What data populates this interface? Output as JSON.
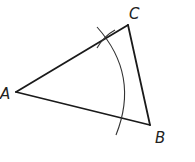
{
  "diagram": {
    "type": "geometric-construction",
    "colors": {
      "stroke": "#1a1a1a",
      "arc": "#333333",
      "background": "#ffffff"
    },
    "vertices": [
      {
        "name": "A",
        "label": "A",
        "x": 16,
        "y": 92,
        "label_x": 0,
        "label_y": 99
      },
      {
        "name": "B",
        "label": "B",
        "x": 150,
        "y": 125,
        "label_x": 155,
        "label_y": 143
      },
      {
        "name": "C",
        "label": "C",
        "x": 128,
        "y": 25,
        "label_x": 129,
        "label_y": 19
      }
    ],
    "sides": [
      "AB",
      "BC",
      "CA"
    ],
    "arcs": [
      {
        "name": "compass-arc",
        "center": "A",
        "crosses": [
          "AC",
          "AB"
        ]
      },
      {
        "name": "intersection-tick",
        "location": "on AC near arc crossing"
      }
    ]
  }
}
